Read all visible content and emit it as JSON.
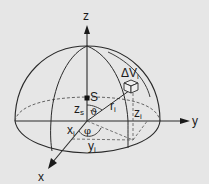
{
  "diagram": {
    "background": "#e6e6e6",
    "stroke_color": "#2a2a2a",
    "axes": {
      "z": {
        "label": "z"
      },
      "y": {
        "label": "y"
      },
      "x": {
        "label": "x"
      }
    },
    "point_S": {
      "label": "S"
    },
    "labels": {
      "zs": {
        "main": "z",
        "sub": "s"
      },
      "theta": "ϑ",
      "phi": "φ",
      "ri": {
        "main": "r",
        "sub": "i"
      },
      "xi": {
        "main": "x",
        "sub": "i"
      },
      "yi": {
        "main": "y",
        "sub": "i"
      },
      "zi": {
        "main": "z",
        "sub": "i"
      },
      "dVi": {
        "main": "ΔV",
        "sub": "i"
      }
    }
  }
}
